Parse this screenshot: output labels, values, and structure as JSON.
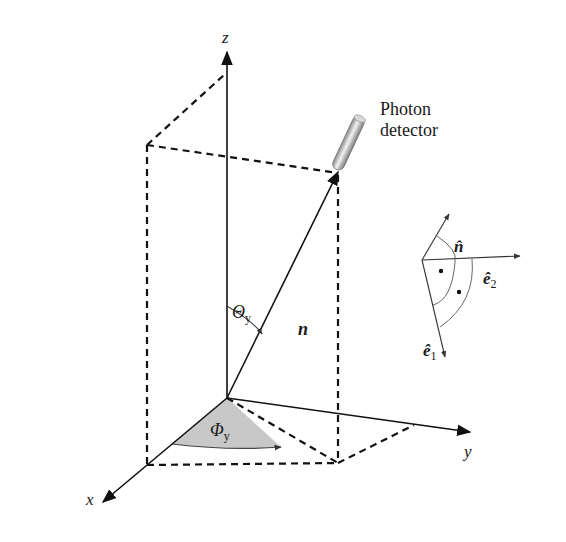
{
  "figure": {
    "labels": {
      "z_axis": "z",
      "x_axis": "x",
      "y_axis": "y",
      "detector_line1": "Photon",
      "detector_line2": "detector",
      "theta": "Θ",
      "theta_sub": "y",
      "phi": "Φ",
      "phi_sub": "y",
      "n_vector": "n",
      "n_hat": "n̂",
      "e1_hat": "ê",
      "e1_sub": "1",
      "e2_hat": "ê",
      "e2_sub": "2"
    },
    "colors": {
      "stroke": "#111111",
      "phi_fill": "#c8c8c8",
      "arc": "#555555",
      "detector_light": "#f2f2f2",
      "detector_dark": "#8a8a8a"
    }
  }
}
